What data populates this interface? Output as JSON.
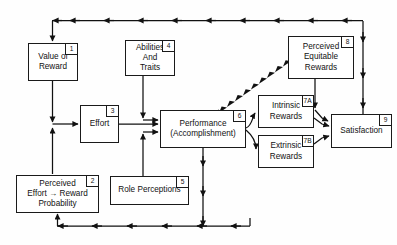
{
  "diagram": {
    "type": "flow-diagram",
    "stroke_color": "#1a1a1a",
    "background_color": "#fefefe",
    "nodes": [
      {
        "id": "1",
        "badge": "1",
        "label": "Value of\nReward"
      },
      {
        "id": "2",
        "badge": "2",
        "label": "Perceived\nEffort → Reward\nProbability"
      },
      {
        "id": "3",
        "badge": "3",
        "label": "Effort"
      },
      {
        "id": "4",
        "badge": "4",
        "label": "Abilities\nAnd\nTraits"
      },
      {
        "id": "5",
        "badge": "5",
        "label": "Role Perceptions"
      },
      {
        "id": "6",
        "badge": "6",
        "label": "Performance\n(Accomplishment)"
      },
      {
        "id": "7a",
        "badge": "7A",
        "label": "Intrinsic\nRewards"
      },
      {
        "id": "7b",
        "badge": "7B",
        "label": "Extrinsic\nRewards"
      },
      {
        "id": "8",
        "badge": "8",
        "label": "Perceived\nEquitable\nRewards"
      },
      {
        "id": "9",
        "badge": "9",
        "label": "Satisfaction"
      }
    ],
    "edges": [
      {
        "from": "9",
        "to": "1",
        "style": "solid",
        "name": "satisfaction-to-value-of-reward-feedback"
      },
      {
        "from": "1",
        "to": "3",
        "style": "solid",
        "name": "value-of-reward-to-effort"
      },
      {
        "from": "2",
        "to": "3",
        "style": "solid",
        "name": "perceived-probability-to-effort"
      },
      {
        "from": "3",
        "to": "6",
        "style": "solid",
        "name": "effort-to-performance"
      },
      {
        "from": "4",
        "to": "6",
        "style": "solid",
        "name": "abilities-to-performance"
      },
      {
        "from": "5",
        "to": "6",
        "style": "solid",
        "name": "role-perceptions-to-performance"
      },
      {
        "from": "6",
        "to": "7a",
        "style": "solid",
        "name": "performance-to-intrinsic-rewards"
      },
      {
        "from": "6",
        "to": "7b",
        "style": "solid",
        "name": "performance-to-extrinsic-rewards"
      },
      {
        "from": "6",
        "to": "8",
        "style": "dashed",
        "name": "performance-to-perceived-equitable-rewards"
      },
      {
        "from": "8",
        "to": "9",
        "style": "solid",
        "name": "perceived-equitable-rewards-to-satisfaction"
      },
      {
        "from": "7a",
        "to": "9",
        "style": "solid",
        "name": "intrinsic-rewards-to-satisfaction"
      },
      {
        "from": "7b",
        "to": "9",
        "style": "solid",
        "name": "extrinsic-rewards-to-satisfaction"
      },
      {
        "from": "6",
        "to": "2",
        "style": "solid",
        "name": "performance-to-perceived-probability-feedback"
      }
    ]
  }
}
